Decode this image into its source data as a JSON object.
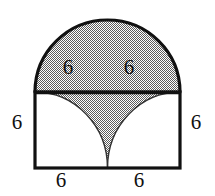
{
  "figure": {
    "shape_description": "Square with shaded semicircle on top and two quarter-circle arcs inside forming a shaded cusp",
    "background_color": "#ffffff",
    "outline_color": "#111111",
    "shading_color": "#9a9a9a",
    "shading_style": "checkerboard-dither",
    "square": {
      "left": 35,
      "top": 92,
      "right": 180,
      "bottom": 168,
      "side_length_label": "6"
    },
    "semicircle": {
      "top": 20,
      "center_x": 107.5,
      "radius_x": 72.5,
      "radius_y": 72,
      "shaded": true
    },
    "arcs": {
      "left_arc_center": "bottom-left-corner",
      "right_arc_center": "bottom-right-corner",
      "radius_label": "6",
      "cusp_x": 107.5,
      "cusp_y": 168
    },
    "labels": {
      "upper_left": "6",
      "upper_right": "6",
      "left_side": "6",
      "right_side": "6",
      "bottom_left": "6",
      "bottom_right": "6"
    }
  }
}
